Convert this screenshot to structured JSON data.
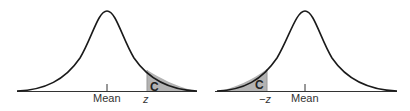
{
  "figures": [
    {
      "id": "right-tail",
      "shaded_region": "right tail",
      "labels": {
        "mean": "Mean",
        "z": "z",
        "area": "C"
      }
    },
    {
      "id": "left-tail",
      "shaded_region": "left tail",
      "labels": {
        "mean": "Mean",
        "z": "−z",
        "area": "C"
      }
    }
  ],
  "colors": {
    "curve": "#1a1a1a",
    "shade": "#b3b3b3",
    "axis": "#333333"
  }
}
